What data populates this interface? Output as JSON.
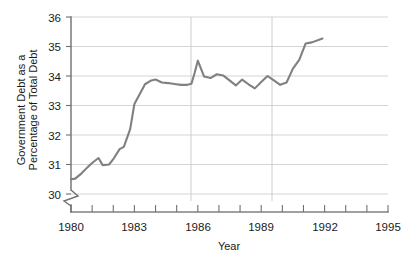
{
  "chart_data": {
    "type": "line",
    "title": "",
    "xlabel": "Year",
    "ylabel": "Government Debt as a Percentage of Total Debt",
    "ylabel_line1": "Government Debt as a",
    "ylabel_line2": "Percentage of Total Debt",
    "xlim": [
      1980,
      1995
    ],
    "ylim": [
      30,
      36
    ],
    "y_axis_break": true,
    "y_axis_break_note": "axis broken below 30",
    "grid": "horizontal and vertical gridlines",
    "legend": "none",
    "series_name": "Government Debt as a Percentage of Total Debt",
    "line_color": "#808080",
    "y_ticks": [
      30,
      31,
      32,
      33,
      34,
      35,
      36
    ],
    "y_tick_labels": [
      "30",
      "31",
      "32",
      "33",
      "34",
      "35",
      "36"
    ],
    "x_ticks": [
      1980,
      1981,
      1982,
      1983,
      1984,
      1985,
      1986,
      1987,
      1988,
      1989,
      1990,
      1991,
      1992,
      1993,
      1994,
      1995
    ],
    "x_tick_labels_shown": [
      "1980",
      "1983",
      "1986",
      "1989",
      "1992",
      "1995"
    ],
    "x_labeled_ticks": [
      1980,
      1983,
      1986,
      1989,
      1992,
      1995
    ],
    "x_vertical_gridlines": [
      1985.7,
      1989.5
    ],
    "data_end_year": 1991.9,
    "x": [
      1980.0,
      1980.2,
      1980.5,
      1980.8,
      1981.0,
      1981.3,
      1981.5,
      1981.8,
      1982.0,
      1982.3,
      1982.5,
      1982.8,
      1983.0,
      1983.3,
      1983.5,
      1983.8,
      1984.0,
      1984.3,
      1984.6,
      1984.9,
      1985.2,
      1985.5,
      1985.7,
      1985.85,
      1986.0,
      1986.3,
      1986.6,
      1986.9,
      1987.2,
      1987.5,
      1987.8,
      1988.1,
      1988.4,
      1988.7,
      1989.0,
      1989.3,
      1989.6,
      1989.9,
      1990.2,
      1990.5,
      1990.8,
      1991.1,
      1991.4,
      1991.9
    ],
    "y": [
      30.5,
      30.52,
      30.7,
      30.92,
      31.05,
      31.22,
      30.98,
      31.0,
      31.18,
      31.52,
      31.6,
      32.2,
      33.05,
      33.45,
      33.72,
      33.85,
      33.88,
      33.78,
      33.76,
      33.73,
      33.7,
      33.7,
      33.74,
      34.1,
      34.52,
      33.98,
      33.93,
      34.06,
      34.02,
      33.85,
      33.68,
      33.88,
      33.72,
      33.58,
      33.8,
      34.0,
      33.85,
      33.7,
      33.78,
      34.25,
      34.55,
      35.1,
      35.14,
      35.27
    ]
  },
  "axis": {
    "y_title_line1": "Government Debt as a",
    "y_title_line2": "Percentage of Total Debt",
    "x_title": "Year"
  }
}
